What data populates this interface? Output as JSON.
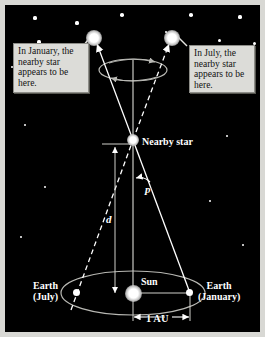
{
  "figure": {
    "background_color": "#000000",
    "frame_color": "#d8d8d4"
  },
  "callouts": [
    {
      "id": "january",
      "text": "In January, the nearby star appears to be here.",
      "background": "#dcdcd8",
      "text_color": "#111111"
    },
    {
      "id": "july",
      "text": "In July, the nearby star appears to be here.",
      "background": "#dcdcd8",
      "text_color": "#111111"
    }
  ],
  "labels": {
    "nearby_star": "Nearby star",
    "sun": "Sun",
    "earth_july": "Earth\n(July)",
    "earth_january": "Earth\n(January)",
    "one_au": "1 AU",
    "parallax_angle": "p",
    "distance": "d"
  },
  "objects": {
    "nearby_star": {
      "x": 128,
      "y": 135
    },
    "sun": {
      "x": 128,
      "y": 288
    },
    "earth_july": {
      "x": 72,
      "y": 288
    },
    "earth_january": {
      "x": 185,
      "y": 288
    },
    "apparent_star_january": {
      "x": 89,
      "y": 33
    },
    "apparent_star_july": {
      "x": 167,
      "y": 33
    }
  },
  "background_stars": [
    {
      "x": 30,
      "y": 13,
      "r": 1.6
    },
    {
      "x": 72,
      "y": 18,
      "r": 1.6
    },
    {
      "x": 117,
      "y": 10,
      "r": 1.8
    },
    {
      "x": 186,
      "y": 10,
      "r": 1.8
    },
    {
      "x": 235,
      "y": 12,
      "r": 1.6
    },
    {
      "x": 161,
      "y": 27,
      "r": 1.3
    },
    {
      "x": 34,
      "y": 37,
      "r": 1.6
    },
    {
      "x": 214,
      "y": 35,
      "r": 1.5
    },
    {
      "x": 249,
      "y": 38,
      "r": 1.5
    },
    {
      "x": 7,
      "y": 62,
      "r": 1.2
    },
    {
      "x": 245,
      "y": 72,
      "r": 1.2
    },
    {
      "x": 20,
      "y": 120,
      "r": 1.1
    },
    {
      "x": 222,
      "y": 131,
      "r": 1.1
    },
    {
      "x": 40,
      "y": 182,
      "r": 1.0
    },
    {
      "x": 205,
      "y": 196,
      "r": 1.0
    },
    {
      "x": 16,
      "y": 232,
      "r": 1.0
    },
    {
      "x": 238,
      "y": 240,
      "r": 1.0
    }
  ],
  "chart_data": {
    "type": "diagram",
    "elements": [
      "Earth orbit ellipse around the Sun",
      "Baseline of 1 AU from Sun to Earth (January)",
      "Sight lines from Earth positions through the nearby star to distant background stars",
      "Apparent annual ellipse traced by the nearby star against background stars",
      "Parallax angle p at the nearby star",
      "Distance d from Earth (July) to the nearby star"
    ],
    "annotations": {
      "baseline_label": "1 AU",
      "angle_label": "p",
      "distance_label": "d"
    }
  }
}
